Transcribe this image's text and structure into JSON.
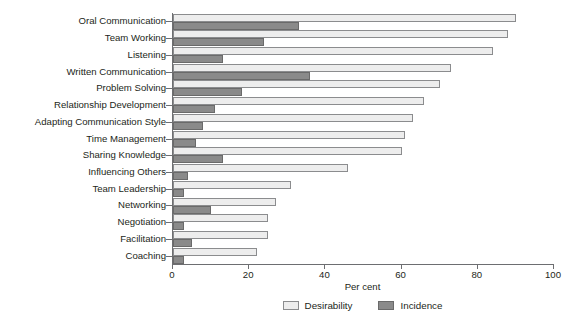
{
  "chart_data": {
    "type": "bar",
    "orientation": "horizontal",
    "title": "",
    "xlabel": "Per cent",
    "ylabel": "",
    "xlim": [
      0,
      100
    ],
    "xticks": [
      0,
      20,
      40,
      60,
      80,
      100
    ],
    "xtick_labels": [
      "0",
      "20",
      "40",
      "60",
      "80",
      "100"
    ],
    "grid": false,
    "legend_position": "bottom-center",
    "categories": [
      "Oral Communication",
      "Team Working",
      "Listening",
      "Written Communication",
      "Problem Solving",
      "Relationship Development",
      "Adapting Communication Style",
      "Time Management",
      "Sharing Knowledge",
      "Influencing Others",
      "Team Leadership",
      "Networking",
      "Negotiation",
      "Facilitation",
      "Coaching"
    ],
    "series": [
      {
        "name": "Desirability",
        "color": "#ededed",
        "values": [
          90,
          88,
          84,
          73,
          70,
          66,
          63,
          61,
          60,
          46,
          31,
          27,
          25,
          25,
          22
        ]
      },
      {
        "name": "Incidence",
        "color": "#8a8a8a",
        "values": [
          33,
          24,
          13,
          36,
          18,
          11,
          8,
          6,
          13,
          4,
          3,
          10,
          3,
          5,
          3
        ]
      }
    ]
  },
  "axis": {
    "x_title": "Per cent"
  },
  "legend": {
    "items": [
      {
        "label": "Desirability"
      },
      {
        "label": "Incidence"
      }
    ]
  },
  "colors": {
    "desirability": "#ededed",
    "incidence": "#8a8a8a",
    "axis": "#6d6e71",
    "text": "#231f20",
    "background": "#ffffff"
  }
}
